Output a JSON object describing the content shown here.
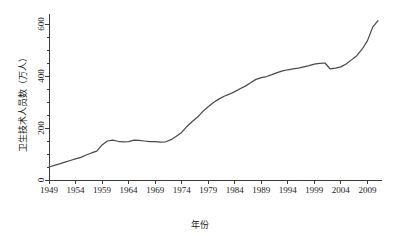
{
  "chart_data": {
    "type": "line",
    "title": "",
    "xlabel": "年份",
    "ylabel": "卫生技术人员数（万人）",
    "xlim": [
      1949,
      2011
    ],
    "ylim": [
      0,
      650
    ],
    "grid": false,
    "legend": false,
    "legend_position": "none",
    "line_color": "#4a4a4a",
    "axis_color": "#3c3c3c",
    "background_color": "#ffffff",
    "xticks": [
      1949,
      1954,
      1959,
      1964,
      1969,
      1974,
      1979,
      1984,
      1989,
      1994,
      1999,
      2004,
      2009
    ],
    "xtick_labels": [
      "1949",
      "1954",
      "1959",
      "1964",
      "1969",
      "1974",
      "1979",
      "1984",
      "1989",
      "1994",
      "1999",
      "2004",
      "2009"
    ],
    "yticks": [
      0,
      200,
      400,
      600
    ],
    "ytick_labels": [
      "0",
      "200",
      "400",
      "600"
    ],
    "y_minor_ticks": [
      50,
      100,
      150,
      250,
      300,
      350,
      450,
      500,
      550
    ],
    "series": [
      {
        "name": "卫生技术人员数",
        "x": [
          1949,
          1950,
          1951,
          1952,
          1953,
          1954,
          1955,
          1956,
          1957,
          1958,
          1959,
          1960,
          1961,
          1962,
          1963,
          1964,
          1965,
          1966,
          1967,
          1968,
          1969,
          1970,
          1971,
          1972,
          1973,
          1974,
          1975,
          1976,
          1977,
          1978,
          1979,
          1980,
          1981,
          1982,
          1983,
          1984,
          1985,
          1986,
          1987,
          1988,
          1989,
          1990,
          1991,
          1992,
          1993,
          1994,
          1995,
          1996,
          1997,
          1998,
          1999,
          2000,
          2001,
          2002,
          2003,
          2004,
          2005,
          2006,
          2007,
          2008,
          2009,
          2010,
          2011
        ],
        "y": [
          50,
          56,
          62,
          69,
          75,
          81,
          87,
          96,
          104,
          111,
          135,
          150,
          153,
          149,
          147,
          148,
          153,
          152,
          150,
          148,
          148,
          146,
          147,
          155,
          168,
          183,
          206,
          225,
          242,
          264,
          282,
          298,
          311,
          322,
          330,
          340,
          351,
          361,
          374,
          387,
          394,
          398,
          405,
          413,
          420,
          424,
          427,
          430,
          435,
          440,
          446,
          449,
          450,
          427,
          430,
          435,
          446,
          462,
          478,
          503,
          535,
          588,
          613
        ],
        "color": "#4a4a4a",
        "style": "solid"
      }
    ],
    "annotations": []
  },
  "axis_labels": {
    "x_title": "年份",
    "y_title": "卫生技术人员数（万人）"
  }
}
